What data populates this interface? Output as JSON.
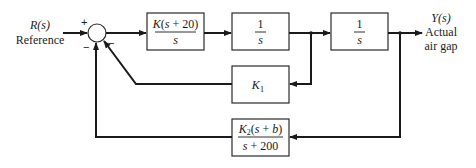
{
  "input": {
    "signal": "R(s)",
    "label": "Reference"
  },
  "output": {
    "signal": "Y(s)",
    "label_line1": "Actual",
    "label_line2": "air gap"
  },
  "summing_junction": {
    "signs": {
      "input": "+",
      "feedback_inner": "−",
      "feedback_outer": "−"
    }
  },
  "blocks": {
    "controller": {
      "numerator": "K(s + 20)",
      "denominator": "s"
    },
    "integrator1": {
      "numerator": "1",
      "denominator": "s"
    },
    "integrator2": {
      "numerator": "1",
      "denominator": "s"
    },
    "inner_feedback": {
      "label": "K",
      "subscript": "1"
    },
    "outer_feedback": {
      "numerator_main": "K",
      "numerator_sub": "2",
      "numerator_rest": "(s + b)",
      "denominator": "s + 200"
    }
  }
}
